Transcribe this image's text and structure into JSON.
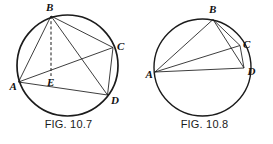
{
  "page": {
    "background_color": "#ffffff",
    "stroke_color": "#1b1b1b",
    "label_color": "#111111"
  },
  "figures": [
    {
      "id": "fig-10-7",
      "caption": "FIG. 10.7",
      "circle": {
        "cx": 67.5,
        "cy": 65.5,
        "r": 50.5,
        "stroke_width": 1.7
      },
      "points": [
        {
          "name": "A",
          "label": "A",
          "x": 18.5,
          "y": 82.0,
          "label_x": 9.5,
          "label_y": 90.0
        },
        {
          "name": "B",
          "label": "B",
          "x": 51.0,
          "y": 16.0,
          "label_x": 46.0,
          "label_y": 11.0
        },
        {
          "name": "C",
          "label": "C",
          "x": 113.0,
          "y": 47.5,
          "label_x": 117.0,
          "label_y": 50.0
        },
        {
          "name": "D",
          "label": "D",
          "x": 107.5,
          "y": 95.0,
          "label_x": 111.0,
          "label_y": 104.0
        },
        {
          "name": "E",
          "label": "E",
          "x": 51.0,
          "y": 76.0,
          "label_x": 47.0,
          "label_y": 86.0
        }
      ],
      "segments": [
        {
          "from": "A",
          "to": "B",
          "style": "solid"
        },
        {
          "from": "B",
          "to": "C",
          "style": "solid"
        },
        {
          "from": "B",
          "to": "D",
          "style": "solid"
        },
        {
          "from": "A",
          "to": "C",
          "style": "solid"
        },
        {
          "from": "A",
          "to": "D",
          "style": "solid"
        },
        {
          "from": "C",
          "to": "D",
          "style": "solid"
        },
        {
          "from": "B",
          "to": "E",
          "style": "dashed"
        }
      ]
    },
    {
      "id": "fig-10-8",
      "caption": "FIG. 10.8",
      "circle": {
        "cx": 66.5,
        "cy": 67.5,
        "r": 48.5,
        "stroke_width": 1.4
      },
      "points": [
        {
          "name": "A",
          "label": "A",
          "x": 19.0,
          "y": 72.0,
          "label_x": 9.5,
          "label_y": 78.0
        },
        {
          "name": "B",
          "label": "B",
          "x": 77.0,
          "y": 19.5,
          "label_x": 73.0,
          "label_y": 13.0
        },
        {
          "name": "C",
          "label": "C",
          "x": 104.0,
          "y": 45.5,
          "label_x": 107.0,
          "label_y": 48.0
        },
        {
          "name": "D",
          "label": "D",
          "x": 108.0,
          "y": 68.0,
          "label_x": 111.5,
          "label_y": 75.0
        }
      ],
      "segments": [
        {
          "from": "A",
          "to": "B",
          "style": "solid"
        },
        {
          "from": "A",
          "to": "C",
          "style": "solid"
        },
        {
          "from": "A",
          "to": "D",
          "style": "solid"
        },
        {
          "from": "B",
          "to": "C",
          "style": "solid"
        },
        {
          "from": "B",
          "to": "D",
          "style": "solid"
        },
        {
          "from": "C",
          "to": "D",
          "style": "solid"
        }
      ]
    }
  ]
}
